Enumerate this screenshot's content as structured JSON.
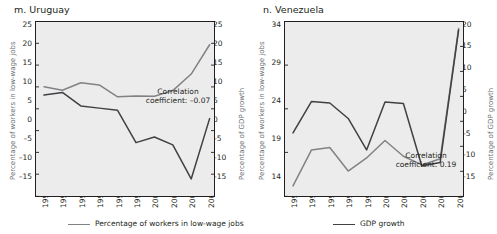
{
  "figure": {
    "background": "#ffffff",
    "plot_background": "#ececec",
    "series_colors": {
      "low_wage": "#808285",
      "gdp": "#414042"
    }
  },
  "legend": {
    "items": [
      {
        "label": "Percentage of workers in low-wage jobs",
        "color": "#808285"
      },
      {
        "label": "GDP growth",
        "color": "#414042"
      }
    ]
  },
  "panels": [
    {
      "id": "uruguay",
      "title": "m. Uruguay",
      "left_axis_title": "Percentage of workers in low-wage jobs",
      "right_axis_title": "Percentage of GDP growth",
      "annotation_line1": "Correlation",
      "annotation_line2": "coefficient: –0.07",
      "left_ticks": [
        "25",
        "20",
        "15",
        "10",
        "5",
        "0",
        "–5",
        "–10",
        "–15"
      ],
      "right_ticks": [
        "25",
        "20",
        "15",
        "10",
        "5",
        "0",
        "–5",
        "–10",
        "–15"
      ],
      "x_ticks": [
        "1992",
        "1995",
        "1996",
        "1997",
        "1998",
        "1999",
        "2000",
        "2001",
        "2002",
        "2003"
      ]
    },
    {
      "id": "venezuela",
      "title": "n. Venezuela",
      "left_axis_title": "Percentage of workers in low-wage jobs",
      "right_axis_title": "Percentage of GDP growth",
      "annotation_line1": "Correlation",
      "annotation_line2": "coefficient: 0.19",
      "left_ticks": [
        "34",
        "29",
        "24",
        "19",
        "14"
      ],
      "right_ticks": [
        "20",
        "15",
        "10",
        "5",
        "0",
        "–5",
        "–10",
        "–15"
      ],
      "x_ticks": [
        "1994",
        "1995",
        "1997",
        "1998",
        "1999",
        "2000",
        "2001",
        "2002",
        "2003",
        "2004"
      ]
    }
  ],
  "chart_data": [
    {
      "type": "line",
      "title": "m. Uruguay",
      "xlabel": "",
      "ylabel": "Percentage of workers in low-wage jobs",
      "y2label": "Percentage of GDP growth",
      "categories": [
        "1992",
        "1995",
        "1996",
        "1997",
        "1998",
        "1999",
        "2000",
        "2001",
        "2002",
        "2003"
      ],
      "ylim": [
        -15,
        25
      ],
      "y2lim": [
        -15,
        25
      ],
      "ytick_step": 5,
      "grid": false,
      "legend_position": "bottom",
      "annotations": [
        "Correlation coefficient: -0.07"
      ],
      "correlation_coefficient": -0.07,
      "series": [
        {
          "name": "Percentage of workers in low-wage jobs",
          "axis": "left",
          "color": "#808285",
          "values": [
            10.1,
            9.3,
            11.0,
            10.5,
            7.8,
            8.0,
            7.9,
            9.2,
            13.0,
            19.7
          ]
        },
        {
          "name": "GDP growth",
          "axis": "right",
          "color": "#414042",
          "values": [
            8.2,
            8.8,
            5.7,
            5.2,
            4.7,
            -2.7,
            -1.4,
            -3.2,
            -11.0,
            2.8
          ]
        }
      ]
    },
    {
      "type": "line",
      "title": "n. Venezuela",
      "xlabel": "",
      "ylabel": "Percentage of workers in low-wage jobs",
      "y2label": "Percentage of GDP growth",
      "categories": [
        "1994",
        "1995",
        "1997",
        "1998",
        "1999",
        "2000",
        "2001",
        "2002",
        "2003",
        "2004"
      ],
      "ylim": [
        14,
        34
      ],
      "y2lim": [
        -15,
        20
      ],
      "ytick_step": 5,
      "grid": false,
      "legend_position": "bottom",
      "annotations": [
        "Correlation coefficient: 0.19"
      ],
      "correlation_coefficient": 0.19,
      "series": [
        {
          "name": "Percentage of workers in low-wage jobs",
          "axis": "left",
          "color": "#808285",
          "values": [
            15.2,
            19.3,
            19.6,
            16.9,
            18.4,
            20.4,
            18.6,
            17.6,
            18.3,
            33.2
          ]
        },
        {
          "name": "GDP growth",
          "axis": "right",
          "color": "#414042",
          "values": [
            -2.3,
            4.0,
            3.7,
            0.6,
            -5.7,
            3.9,
            3.6,
            -8.9,
            -8.2,
            18.3
          ]
        }
      ]
    }
  ]
}
